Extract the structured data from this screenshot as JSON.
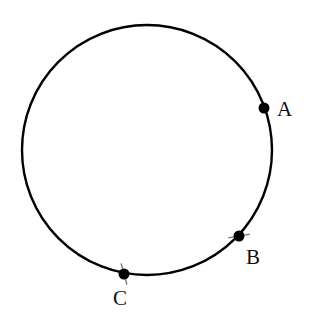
{
  "figure": {
    "type": "geometry-circle",
    "circle": {
      "cx": 147,
      "cy": 150,
      "r": 125,
      "stroke": "#000000",
      "stroke_width": 2.4
    },
    "points": [
      {
        "id": "A",
        "label": "A",
        "x": 264,
        "y": 108,
        "label_x": 277,
        "label_y": 116,
        "tick": false
      },
      {
        "id": "B",
        "label": "B",
        "x": 239,
        "y": 236,
        "label_x": 246,
        "label_y": 264,
        "tick": true,
        "tick_angle": -10
      },
      {
        "id": "C",
        "label": "C",
        "x": 124,
        "y": 274,
        "label_x": 113,
        "label_y": 305,
        "tick": true,
        "tick_angle": 75
      }
    ],
    "point_color": "#000000",
    "tick_color": "#777777"
  }
}
